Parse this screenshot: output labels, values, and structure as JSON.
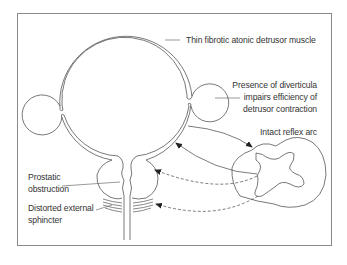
{
  "diagram": {
    "type": "anatomical-schematic",
    "labels": {
      "detrusor": "Thin fibrotic atonic detrusor muscle",
      "diverticula_line1": "Presence of diverticula",
      "diverticula_line2": "impairs efficiency of",
      "diverticula_line3": "detrusor contraction",
      "reflex_arc": "Intact reflex arc",
      "prostatic_line1": "Prostatic",
      "prostatic_line2": "obstruction",
      "sphincter_line1": "Distorted external",
      "sphincter_line2": "sphincter"
    },
    "structures": [
      "bladder",
      "left-diverticulum",
      "right-diverticulum",
      "prostate",
      "external-sphincter",
      "urethra",
      "spinal-cord-cross-section"
    ],
    "connections": [
      {
        "from": "bladder-wall",
        "to": "spinal-cord",
        "style": "solid",
        "arrow": "to"
      },
      {
        "from": "spinal-cord",
        "to": "bladder-wall",
        "style": "solid",
        "arrow": "to"
      },
      {
        "from": "spinal-cord",
        "to": "bladder-neck",
        "style": "dashed",
        "arrow": "to"
      },
      {
        "from": "spinal-cord",
        "to": "external-sphincter",
        "style": "dashed",
        "arrow": "to"
      }
    ],
    "colors": {
      "line": "#555555",
      "text": "#333333",
      "frame": "#8a8a8a",
      "background": "#ffffff"
    }
  }
}
